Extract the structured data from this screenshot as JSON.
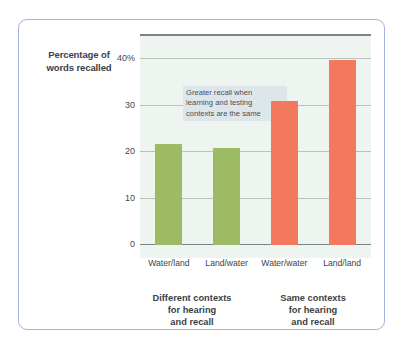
{
  "chart_data": {
    "type": "bar",
    "title": "",
    "subtitle": "",
    "xlabel": "",
    "ylabel": "Percentage of words recalled",
    "ylim": [
      0,
      45
    ],
    "grid": true,
    "legend": "none",
    "categories": [
      "Water/land",
      "Land/water",
      "Water/water",
      "Land/land"
    ],
    "values": [
      21.5,
      20.7,
      30.8,
      39.7
    ],
    "bar_colors": [
      "#9cbb63",
      "#9cbb63",
      "#f2795e",
      "#f2795e"
    ],
    "yticks": [
      {
        "value": 0,
        "label": "0"
      },
      {
        "value": 10,
        "label": "10"
      },
      {
        "value": 20,
        "label": "20"
      },
      {
        "value": 30,
        "label": "30"
      },
      {
        "value": 40,
        "label": "40%"
      }
    ],
    "annotations": [
      {
        "text": "Greater recall when learning and testing contexts are the same",
        "background": "#dde6ea"
      }
    ],
    "group_captions": [
      "Different contexts for hearing and recall",
      "Same contexts for hearing and recall"
    ]
  },
  "axis_title": {
    "line1": "Percentage of",
    "line2": "words recalled"
  },
  "annotation": {
    "line1": "Greater recall when",
    "line2": "learning and testing",
    "line3": "contexts are the same"
  },
  "groups": [
    {
      "line1": "Different contexts",
      "line2": "for hearing",
      "line3": "and recall"
    },
    {
      "line1": "Same contexts",
      "line2": "for hearing",
      "line3": "and recall"
    }
  ],
  "colors": {
    "card_border": "#a9b1dd",
    "plot_background": "#eef4ef",
    "gridline": "#b9c2bb",
    "axis": "#7d8287",
    "green": "#9cbb63",
    "orange": "#f2795e",
    "annotation_bg": "#dde6ea",
    "text": "#3b3f46"
  }
}
